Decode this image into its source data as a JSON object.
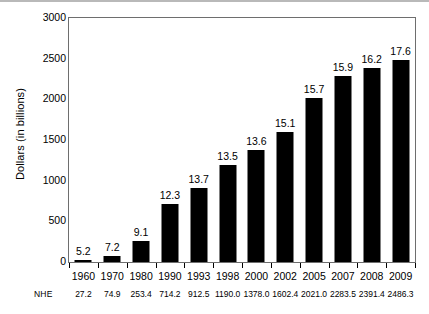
{
  "chart_data": {
    "type": "bar",
    "title": "",
    "subtitle": "",
    "xlabel": "",
    "ylabel": "Dollars (in billions)",
    "ylim": [
      0,
      3000
    ],
    "ytick_labels": [
      "0",
      "500",
      "1000",
      "1500",
      "2000",
      "2500",
      "3000"
    ],
    "ytick_values": [
      0,
      500,
      1000,
      1500,
      2000,
      2500,
      3000
    ],
    "grid": false,
    "legend": "none",
    "bar_color": "#000000",
    "plot_background": "#ffffff",
    "frame_color": "#6e6e6e",
    "categories": [
      "1960",
      "1970",
      "1980",
      "1990",
      "1993",
      "1998",
      "2000",
      "2002",
      "2005",
      "2007",
      "2008",
      "2009"
    ],
    "values": [
      27.2,
      74.9,
      253.4,
      714.2,
      912.5,
      1190.0,
      1378.0,
      1602.4,
      2021.0,
      2283.5,
      2391.4,
      2486.3
    ],
    "bar_labels": [
      "5.2",
      "7.2",
      "9.1",
      "12.3",
      "13.7",
      "13.5",
      "13.6",
      "15.1",
      "15.7",
      "15.9",
      "16.2",
      "17.6"
    ],
    "annotations": {
      "row_label": "NHE",
      "row_values": [
        "27.2",
        "74.9",
        "253.4",
        "714.2",
        "912.5",
        "1190.0",
        "1378.0",
        "1602.4",
        "2021.0",
        "2283.5",
        "2391.4",
        "2486.3"
      ]
    }
  }
}
